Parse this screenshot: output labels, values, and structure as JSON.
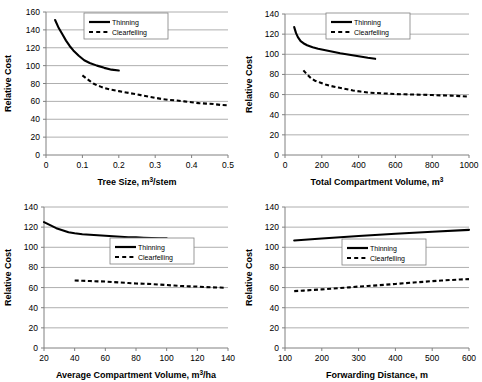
{
  "figure": {
    "name": "relative-cost-four-panel-figure",
    "panel_count": 4,
    "shared_ylabel": "Relative Cost",
    "series_names": [
      "Thinning",
      "Clearfelling"
    ],
    "colors": {
      "line": "#000000",
      "grid": "#808080",
      "axis": "#808080",
      "background": "#ffffff"
    }
  },
  "legend": {
    "thinning_label": "Thinning",
    "clearfelling_label": "Clearfelling",
    "thinning_style": "solid",
    "clearfelling_style": "dashed"
  },
  "chart_data": [
    {
      "id": "tree-size",
      "type": "line",
      "title": "",
      "xlabel": "Tree Size, m3/stem",
      "xlabel_base": "Tree Size, m",
      "xlabel_sup": "3",
      "xlabel_tail": "/stem",
      "ylabel": "Relative Cost",
      "xlim": [
        0,
        0.5
      ],
      "ylim": [
        0,
        160
      ],
      "xticks": [
        "0",
        "0.1",
        "0.2",
        "0.3",
        "0.4",
        "0.5"
      ],
      "xtick_values": [
        0,
        0.1,
        0.2,
        0.3,
        0.4,
        0.5
      ],
      "yticks": [
        "0",
        "20",
        "40",
        "60",
        "80",
        "100",
        "120",
        "140",
        "160"
      ],
      "ytick_values": [
        0,
        20,
        40,
        60,
        80,
        100,
        120,
        140,
        160
      ],
      "grid": "horizontal",
      "legend_position": "top-center",
      "series": [
        {
          "name": "Thinning",
          "style": "solid",
          "x": [
            0.025,
            0.035,
            0.045,
            0.055,
            0.065,
            0.075,
            0.09,
            0.105,
            0.12,
            0.14,
            0.16,
            0.18,
            0.2
          ],
          "values": [
            151,
            142,
            135,
            128,
            122,
            117,
            111,
            106,
            103,
            100,
            97.5,
            95.5,
            94.5
          ]
        },
        {
          "name": "Clearfelling",
          "style": "dashed",
          "x": [
            0.1,
            0.12,
            0.13,
            0.14,
            0.15,
            0.16,
            0.18,
            0.2,
            0.22,
            0.24,
            0.26,
            0.28,
            0.3,
            0.32,
            0.34,
            0.36,
            0.38,
            0.4,
            0.42,
            0.44,
            0.46,
            0.48,
            0.5
          ],
          "values": [
            89,
            83,
            80,
            78,
            76.5,
            75,
            73,
            71.5,
            70,
            68.5,
            67,
            65.5,
            64,
            62.5,
            61.5,
            61,
            60,
            59,
            58,
            57.5,
            57,
            56,
            55.5
          ]
        }
      ]
    },
    {
      "id": "total-compartment-volume",
      "type": "line",
      "title": "",
      "xlabel": "Total Compartment Volume, m3",
      "xlabel_base": "Total Compartment Volume, m",
      "xlabel_sup": "3",
      "xlabel_tail": "",
      "ylabel": "Relative Cost",
      "xlim": [
        0,
        1000
      ],
      "ylim": [
        0,
        140
      ],
      "xticks": [
        "0",
        "200",
        "400",
        "600",
        "800",
        "1000"
      ],
      "xtick_values": [
        0,
        200,
        400,
        600,
        800,
        1000
      ],
      "yticks": [
        "0",
        "20",
        "40",
        "60",
        "80",
        "100",
        "120",
        "140"
      ],
      "ytick_values": [
        0,
        20,
        40,
        60,
        80,
        100,
        120,
        140
      ],
      "grid": "horizontal",
      "legend_position": "top-center",
      "series": [
        {
          "name": "Thinning",
          "style": "solid",
          "x": [
            50,
            60,
            70,
            85,
            100,
            120,
            150,
            180,
            220,
            260,
            300,
            350,
            400,
            450,
            490
          ],
          "values": [
            127,
            121,
            117,
            113,
            111,
            109,
            107,
            105.5,
            104,
            102.5,
            101,
            99.5,
            98,
            96.5,
            95.5
          ]
        },
        {
          "name": "Clearfelling",
          "style": "dashed",
          "x": [
            100,
            120,
            140,
            160,
            190,
            220,
            250,
            290,
            330,
            370,
            410,
            450,
            500,
            550,
            600,
            650,
            700,
            750,
            800,
            850,
            900,
            950,
            990
          ],
          "values": [
            84,
            80,
            76.5,
            74,
            72,
            70,
            68.5,
            67,
            65.5,
            64,
            63,
            62,
            61.5,
            61,
            60.5,
            60.3,
            60,
            59.8,
            59.5,
            59.2,
            59,
            58.5,
            58
          ]
        }
      ]
    },
    {
      "id": "average-compartment-volume",
      "type": "line",
      "title": "",
      "xlabel": "Average Compartment Volume, m3/ha",
      "xlabel_base": "Average Compartment Volume, m",
      "xlabel_sup": "3",
      "xlabel_tail": "/ha",
      "ylabel": "Relative Cost",
      "xlim": [
        20,
        140
      ],
      "ylim": [
        0,
        140
      ],
      "xticks": [
        "20",
        "40",
        "60",
        "80",
        "100",
        "120",
        "140"
      ],
      "xtick_values": [
        20,
        40,
        60,
        80,
        100,
        120,
        140
      ],
      "yticks": [
        "0",
        "20",
        "40",
        "60",
        "80",
        "100",
        "120",
        "140"
      ],
      "ytick_values": [
        0,
        20,
        40,
        60,
        80,
        100,
        120,
        140
      ],
      "grid": "horizontal",
      "legend_position": "middle-right",
      "series": [
        {
          "name": "Thinning",
          "style": "solid",
          "x": [
            20,
            24,
            28,
            32,
            36,
            40,
            45,
            50,
            55,
            60,
            65,
            70,
            75,
            80,
            85,
            90,
            95,
            100
          ],
          "values": [
            125,
            122,
            119,
            117,
            115,
            114,
            113,
            112.5,
            112,
            111.5,
            111,
            110.5,
            110,
            109.8,
            109.5,
            109.2,
            109,
            108.8
          ]
        },
        {
          "name": "Clearfelling",
          "style": "dashed",
          "x": [
            40,
            45,
            50,
            55,
            60,
            65,
            70,
            75,
            80,
            85,
            90,
            95,
            100,
            105,
            110,
            115,
            120,
            125,
            130,
            135,
            138
          ],
          "values": [
            67,
            66.8,
            66.5,
            66.2,
            66,
            65.5,
            65,
            64.5,
            64,
            63.8,
            63.5,
            63,
            62.5,
            62,
            61.5,
            61.2,
            61,
            60.5,
            60.2,
            60,
            59.8
          ]
        }
      ]
    },
    {
      "id": "forwarding-distance",
      "type": "line",
      "title": "",
      "xlabel": "Forwarding Distance, m",
      "xlabel_base": "Forwarding Distance, m",
      "xlabel_sup": "",
      "xlabel_tail": "",
      "ylabel": "Relative Cost",
      "xlim": [
        100,
        600
      ],
      "ylim": [
        0,
        140
      ],
      "xticks": [
        "100",
        "200",
        "300",
        "400",
        "500",
        "600"
      ],
      "xtick_values": [
        100,
        200,
        300,
        400,
        500,
        600
      ],
      "yticks": [
        "0",
        "20",
        "40",
        "60",
        "80",
        "100",
        "120",
        "140"
      ],
      "ytick_values": [
        0,
        20,
        40,
        60,
        80,
        100,
        120,
        140
      ],
      "grid": "horizontal",
      "legend_position": "middle-right",
      "series": [
        {
          "name": "Thinning",
          "style": "solid",
          "x": [
            125,
            200,
            300,
            400,
            500,
            600
          ],
          "values": [
            106.8,
            108.8,
            111.2,
            113.4,
            115.4,
            117.3
          ]
        },
        {
          "name": "Clearfelling",
          "style": "dashed",
          "x": [
            125,
            150,
            175,
            200,
            225,
            250,
            275,
            300,
            325,
            350,
            375,
            400,
            425,
            450,
            475,
            500,
            525,
            550,
            575,
            600
          ],
          "values": [
            56.5,
            57,
            57.6,
            58.2,
            58.8,
            59.5,
            60.2,
            61,
            61.6,
            62.2,
            62.9,
            63.6,
            64.3,
            65,
            65.7,
            66.4,
            67,
            67.5,
            68,
            68.4
          ]
        }
      ]
    }
  ]
}
